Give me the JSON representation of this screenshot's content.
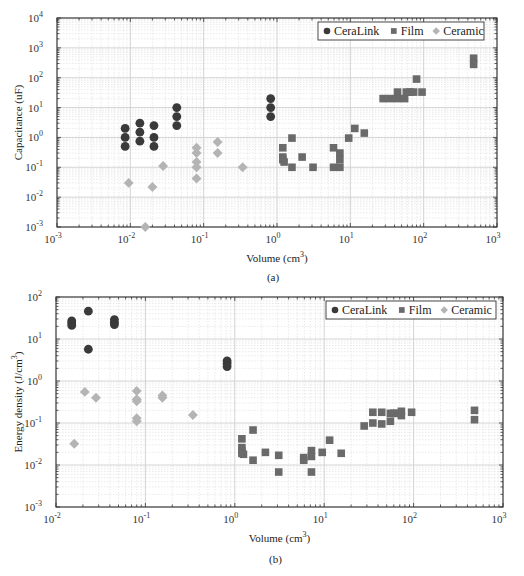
{
  "colors": {
    "ceralink": "#3a3a3a",
    "film": "#6a6a6a",
    "ceramic": "#b4b4b4",
    "grid_major": "#cfcfcf",
    "grid_minor": "#e4e4e4",
    "axis": "#333333"
  },
  "chart_data": [
    {
      "id": "a",
      "type": "scatter",
      "title": "",
      "caption": "(a)",
      "xlabel": "Volume (cm3)",
      "ylabel": "Capacitance (uF)",
      "xscale": "log",
      "yscale": "log",
      "xlim": [
        0.001,
        1000
      ],
      "ylim": [
        0.001,
        10000
      ],
      "x_ticks": [
        "10^-3",
        "10^-2",
        "10^-1",
        "10^0",
        "10^1",
        "10^2",
        "10^3"
      ],
      "y_ticks": [
        "10^-3",
        "10^-2",
        "10^-1",
        "10^0",
        "10^1",
        "10^2",
        "10^3",
        "10^4"
      ],
      "grid": true,
      "legend_position": "upper right",
      "legend": [
        "CeraLink",
        "Film",
        "Ceramic"
      ],
      "series": [
        {
          "name": "CeraLink",
          "marker": "circle",
          "points": [
            [
              0.0085,
              2
            ],
            [
              0.0085,
              1
            ],
            [
              0.0085,
              0.5
            ],
            [
              0.0135,
              3
            ],
            [
              0.0135,
              1.5
            ],
            [
              0.0135,
              0.75
            ],
            [
              0.021,
              2.5
            ],
            [
              0.021,
              1
            ],
            [
              0.021,
              0.5
            ],
            [
              0.043,
              10
            ],
            [
              0.043,
              5
            ],
            [
              0.043,
              2.5
            ],
            [
              0.82,
              20
            ],
            [
              0.82,
              10
            ],
            [
              0.82,
              5
            ]
          ]
        },
        {
          "name": "Film",
          "marker": "square",
          "points": [
            [
              1.2,
              0.45
            ],
            [
              1.2,
              0.22
            ],
            [
              1.2,
              0.18
            ],
            [
              1.25,
              0.15
            ],
            [
              1.6,
              0.95
            ],
            [
              1.6,
              0.1
            ],
            [
              2.2,
              0.22
            ],
            [
              3.1,
              0.1
            ],
            [
              5.9,
              0.45
            ],
            [
              7.2,
              0.3
            ],
            [
              7.2,
              0.18
            ],
            [
              5.9,
              0.1
            ],
            [
              7.2,
              0.1
            ],
            [
              9.5,
              0.95
            ],
            [
              11.5,
              2
            ],
            [
              15.5,
              1.4
            ],
            [
              28,
              20
            ],
            [
              35,
              20
            ],
            [
              44,
              20
            ],
            [
              55,
              20
            ],
            [
              44,
              33
            ],
            [
              58,
              33
            ],
            [
              65,
              33
            ],
            [
              73,
              33
            ],
            [
              95,
              33
            ],
            [
              80,
              90
            ],
            [
              480,
              450
            ],
            [
              480,
              280
            ]
          ]
        },
        {
          "name": "Ceramic",
          "marker": "diamond",
          "points": [
            [
              0.0095,
              0.03
            ],
            [
              0.016,
              0.001
            ],
            [
              0.02,
              0.022
            ],
            [
              0.028,
              0.11
            ],
            [
              0.08,
              0.45
            ],
            [
              0.08,
              0.3
            ],
            [
              0.08,
              0.15
            ],
            [
              0.08,
              0.1
            ],
            [
              0.08,
              0.042
            ],
            [
              0.155,
              0.7
            ],
            [
              0.155,
              0.3
            ],
            [
              0.34,
              0.1
            ]
          ]
        }
      ]
    },
    {
      "id": "b",
      "type": "scatter",
      "title": "",
      "caption": "(b)",
      "xlabel": "Volume (cm3)",
      "ylabel": "Energy density (J/cm3)",
      "xscale": "log",
      "yscale": "log",
      "xlim": [
        0.01,
        1000
      ],
      "ylim": [
        0.001,
        100
      ],
      "x_ticks": [
        "10^-2",
        "10^-1",
        "10^0",
        "10^1",
        "10^2",
        "10^3"
      ],
      "y_ticks": [
        "10^-3",
        "10^-2",
        "10^-1",
        "10^0",
        "10^1",
        "10^2"
      ],
      "grid": true,
      "legend_position": "upper right",
      "legend": [
        "CeraLink",
        "Film",
        "Ceramic"
      ],
      "series": [
        {
          "name": "CeraLink",
          "marker": "circle",
          "points": [
            [
              0.015,
              27
            ],
            [
              0.015,
              24
            ],
            [
              0.015,
              21
            ],
            [
              0.023,
              46
            ],
            [
              0.023,
              5.7
            ],
            [
              0.045,
              29
            ],
            [
              0.045,
              25
            ],
            [
              0.045,
              22
            ],
            [
              0.82,
              3
            ],
            [
              0.82,
              2.6
            ],
            [
              0.82,
              2.2
            ]
          ]
        },
        {
          "name": "Film",
          "marker": "square",
          "points": [
            [
              1.2,
              0.042
            ],
            [
              1.2,
              0.026
            ],
            [
              1.2,
              0.022
            ],
            [
              1.2,
              0.019
            ],
            [
              1.25,
              0.018
            ],
            [
              1.6,
              0.068
            ],
            [
              1.6,
              0.013
            ],
            [
              2.2,
              0.02
            ],
            [
              3.1,
              0.017
            ],
            [
              3.1,
              0.0068
            ],
            [
              5.9,
              0.015
            ],
            [
              5.9,
              0.013
            ],
            [
              7.2,
              0.022
            ],
            [
              7.2,
              0.016
            ],
            [
              7.2,
              0.0068
            ],
            [
              9.5,
              0.02
            ],
            [
              11.5,
              0.039
            ],
            [
              15.5,
              0.019
            ],
            [
              28,
              0.085
            ],
            [
              35,
              0.1
            ],
            [
              44,
              0.095
            ],
            [
              55,
              0.11
            ],
            [
              35,
              0.18
            ],
            [
              44,
              0.18
            ],
            [
              55,
              0.17
            ],
            [
              60,
              0.17
            ],
            [
              65,
              0.17
            ],
            [
              73,
              0.19
            ],
            [
              73,
              0.15
            ],
            [
              95,
              0.18
            ],
            [
              480,
              0.2
            ],
            [
              480,
              0.12
            ]
          ]
        },
        {
          "name": "Ceramic",
          "marker": "diamond",
          "points": [
            [
              0.016,
              0.032
            ],
            [
              0.021,
              0.55
            ],
            [
              0.028,
              0.4
            ],
            [
              0.08,
              0.58
            ],
            [
              0.08,
              0.37
            ],
            [
              0.08,
              0.33
            ],
            [
              0.08,
              0.13
            ],
            [
              0.08,
              0.11
            ],
            [
              0.155,
              0.45
            ],
            [
              0.155,
              0.4
            ],
            [
              0.34,
              0.155
            ]
          ]
        }
      ]
    }
  ]
}
